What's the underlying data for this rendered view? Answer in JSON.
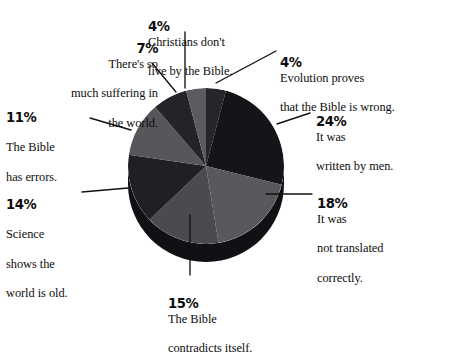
{
  "chart_data": {
    "type": "pie",
    "title": "",
    "subtitle": "",
    "style": "3d-pie",
    "legend_position": "callout-labels",
    "grid": false,
    "total": 97,
    "categories": [
      "Evolution proves that the Bible is wrong.",
      "It was written by men.",
      "It was not translated correctly.",
      "The Bible contradicts itself.",
      "Science shows the world is old.",
      "The Bible has errors.",
      "There's so much suffering in the world.",
      "Christians don't live by the Bible."
    ],
    "values": [
      4,
      24,
      18,
      15,
      14,
      11,
      7,
      4
    ],
    "colors": [
      "#25262a",
      "#141518",
      "#58595d",
      "#4a4b4f",
      "#1f2024",
      "#56575b",
      "#232428",
      "#5b5c60"
    ],
    "slices": [
      {
        "id": "evolution",
        "percent_label": "4%",
        "value": 4,
        "text": "Evolution proves that the Bible is wrong.",
        "color": "#25262a",
        "start_deg": 0,
        "end_deg": 14.85
      },
      {
        "id": "written-by-men",
        "percent_label": "24%",
        "value": 24,
        "text": "It was written by men.",
        "color": "#141518",
        "start_deg": 14.85,
        "end_deg": 103.92
      },
      {
        "id": "not-translated",
        "percent_label": "18%",
        "value": 18,
        "text": "It was not translated correctly.",
        "color": "#58595d",
        "start_deg": 103.92,
        "end_deg": 170.72
      },
      {
        "id": "contradicts",
        "percent_label": "15%",
        "value": 15,
        "text": "The Bible contradicts itself.",
        "color": "#4a4b4f",
        "start_deg": 170.72,
        "end_deg": 226.39
      },
      {
        "id": "science",
        "percent_label": "14%",
        "value": 14,
        "text": "Science shows the world is old.",
        "color": "#1f2024",
        "start_deg": 226.39,
        "end_deg": 278.35
      },
      {
        "id": "bible-errors",
        "percent_label": "11%",
        "value": 11,
        "text": "The Bible has errors.",
        "color": "#56575b",
        "start_deg": 278.35,
        "end_deg": 319.17
      },
      {
        "id": "suffering",
        "percent_label": "7%",
        "value": 7,
        "text": "There's so much suffering in the world.",
        "color": "#232428",
        "start_deg": 319.17,
        "end_deg": 345.15
      },
      {
        "id": "christians",
        "percent_label": "4%",
        "value": 4,
        "text": "Christians don't live by the Bible.",
        "color": "#5b5c60",
        "start_deg": 345.15,
        "end_deg": 360
      }
    ]
  },
  "labels": {
    "suffering": {
      "pct": "7%",
      "line1": "There's so",
      "line2": "much suffering in",
      "line3": "the world."
    },
    "christians": {
      "pct": "4%",
      "line1": "Christians don't",
      "line2": "live by the Bible.",
      "line3": ""
    },
    "evolution": {
      "pct": "4%",
      "line1": "Evolution proves",
      "line2": "that the Bible is wrong.",
      "line3": ""
    },
    "written": {
      "pct": "24%",
      "line1": "It was",
      "line2": "written by men.",
      "line3": ""
    },
    "errors": {
      "pct": "11%",
      "line1": "",
      "line2": "The Bible",
      "line3": "has errors."
    },
    "translated": {
      "pct": "18%",
      "line1": "It was",
      "line2": "not translated",
      "line3": "correctly."
    },
    "science": {
      "pct": "14%",
      "line1": "",
      "line2": "Science",
      "line3": "shows the",
      "line4": "world is old."
    },
    "contradicts": {
      "pct": "15%",
      "line1": "The Bible",
      "line2": "contradicts itself.",
      "line3": ""
    }
  },
  "colors": {
    "background": "#ffffff",
    "text": "#0d0d0d",
    "leader_line": "#111111",
    "pie_edge": "#101114"
  }
}
